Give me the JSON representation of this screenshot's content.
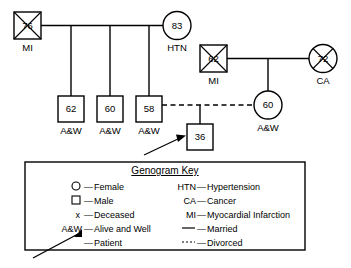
{
  "diagram": {
    "type": "genogram",
    "generations": [
      {
        "name": "grandparents",
        "people": [
          {
            "id": "g1m",
            "shape": "square",
            "age": "76",
            "label": "MI",
            "deceased": true,
            "sex": "male"
          },
          {
            "id": "g1f",
            "shape": "circle",
            "age": "83",
            "label": "HTN",
            "deceased": false,
            "sex": "female"
          }
        ]
      },
      {
        "name": "parents",
        "people": [
          {
            "id": "g2m",
            "shape": "square",
            "age": "62",
            "label": "MI",
            "deceased": true,
            "sex": "male"
          },
          {
            "id": "g2f",
            "shape": "circle",
            "age": "72",
            "label": "CA",
            "deceased": true,
            "sex": "female"
          }
        ]
      },
      {
        "name": "children",
        "people": [
          {
            "id": "c1",
            "shape": "square",
            "age": "62",
            "label": "A&W",
            "deceased": false,
            "sex": "male"
          },
          {
            "id": "c2",
            "shape": "square",
            "age": "60",
            "label": "A&W",
            "deceased": false,
            "sex": "male"
          },
          {
            "id": "c3",
            "shape": "square",
            "age": "58",
            "label": "A&W",
            "deceased": false,
            "sex": "male"
          },
          {
            "id": "c4",
            "shape": "circle",
            "age": "60",
            "label": "A&W",
            "deceased": false,
            "sex": "female"
          }
        ]
      },
      {
        "name": "patient-generation",
        "people": [
          {
            "id": "p1",
            "shape": "square",
            "age": "36",
            "label": "",
            "deceased": false,
            "sex": "male",
            "is_patient": true
          }
        ]
      }
    ],
    "relationships": [
      {
        "from": "g1m",
        "to": "g1f",
        "type": "married"
      },
      {
        "from": "g2m",
        "to": "g2f",
        "type": "married"
      },
      {
        "from": "c3",
        "to": "c4",
        "type": "divorced"
      }
    ]
  },
  "key": {
    "title": "Genogram Key",
    "left_column": [
      {
        "symbol": "circle",
        "symbol_text": "",
        "description": "Female"
      },
      {
        "symbol": "square",
        "symbol_text": "",
        "description": "Male"
      },
      {
        "symbol": "x",
        "symbol_text": "x",
        "description": "Deceased"
      },
      {
        "symbol": "text",
        "symbol_text": "A&W",
        "description": "Alive and Well"
      },
      {
        "symbol": "arrow",
        "symbol_text": "",
        "description": "Patient"
      }
    ],
    "right_column": [
      {
        "symbol": "text",
        "symbol_text": "HTN",
        "description": "Hypertension"
      },
      {
        "symbol": "text",
        "symbol_text": "CA",
        "description": "Cancer"
      },
      {
        "symbol": "text",
        "symbol_text": "MI",
        "description": "Myocardial Infarction"
      },
      {
        "symbol": "solid-line",
        "symbol_text": "",
        "description": "Married"
      },
      {
        "symbol": "dotted-line",
        "symbol_text": "",
        "description": "Divorced"
      }
    ],
    "dash": "—"
  },
  "colors": {
    "stroke": "#000000",
    "fill": "#ffffff",
    "background": "#ffffff"
  }
}
